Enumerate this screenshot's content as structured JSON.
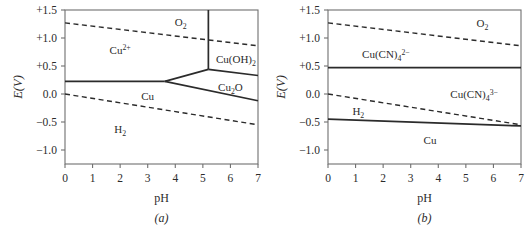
{
  "figure": {
    "panels": [
      {
        "id": "a",
        "caption": "(a)",
        "axes": {
          "xlabel": "pH",
          "ylabel": "E (V)",
          "ylabel_italic": "E",
          "ylabel_paren": "(V)",
          "xlim": [
            0,
            7
          ],
          "ylim": [
            -1.25,
            1.5
          ],
          "xticks": [
            "0",
            "1",
            "2",
            "3",
            "4",
            "5",
            "6",
            "7"
          ],
          "xtick_values": [
            0,
            1,
            2,
            3,
            4,
            5,
            6,
            7
          ],
          "yticks": [
            "+1.5",
            "+1.0",
            "+0.5",
            "0.0",
            "−0.5",
            "−1.0"
          ],
          "ytick_values": [
            1.5,
            1.0,
            0.5,
            0.0,
            -0.5,
            -1.0
          ],
          "grid": false
        },
        "regions": [
          {
            "name": "cu2plus",
            "text": "Cu",
            "sup": "2+",
            "sub": "",
            "x": 2.0,
            "y": 0.78
          },
          {
            "name": "o2",
            "text": "O",
            "sup": "",
            "sub": "2",
            "x": 4.2,
            "y": 1.28
          },
          {
            "name": "cu-oh-2",
            "text": "Cu(OH)",
            "sup": "",
            "sub": "2",
            "x": 6.2,
            "y": 0.62
          },
          {
            "name": "cu2o",
            "text": "Cu",
            "sup": "",
            "sub": "2",
            "text2": "O",
            "x": 6.0,
            "y": 0.12
          },
          {
            "name": "cu-metal",
            "text": "Cu",
            "sup": "",
            "sub": "",
            "x": 3.0,
            "y": -0.03
          },
          {
            "name": "h2",
            "text": "H",
            "sup": "",
            "sub": "2",
            "x": 2.0,
            "y": -0.62
          }
        ],
        "lines": [
          {
            "name": "o2-water-stability-upper",
            "style": "dashed",
            "points": [
              [
                0,
                1.27
              ],
              [
                7,
                0.86
              ]
            ]
          },
          {
            "name": "h2-water-stability-lower",
            "style": "dashed",
            "points": [
              [
                0,
                0.0
              ],
              [
                7,
                -0.55
              ]
            ]
          },
          {
            "name": "cu2plus-cu-boundary",
            "style": "solid",
            "points": [
              [
                0,
                0.225
              ],
              [
                3.62,
                0.225
              ]
            ]
          },
          {
            "name": "cu2plus-cu2o-boundary",
            "style": "solid",
            "points": [
              [
                3.62,
                0.225
              ],
              [
                5.2,
                0.44
              ]
            ]
          },
          {
            "name": "cu-cu2o-boundary",
            "style": "solid",
            "points": [
              [
                3.62,
                0.225
              ],
              [
                7,
                -0.12
              ]
            ]
          },
          {
            "name": "cu2plus-cu-oh-2-vertical",
            "style": "solid",
            "points": [
              [
                5.2,
                1.5
              ],
              [
                5.2,
                0.44
              ]
            ]
          },
          {
            "name": "cu2o-cu-oh-2-boundary",
            "style": "solid",
            "points": [
              [
                5.2,
                0.44
              ],
              [
                7,
                0.33
              ]
            ]
          }
        ]
      },
      {
        "id": "b",
        "caption": "(b)",
        "axes": {
          "xlabel": "pH",
          "ylabel": "E (V)",
          "ylabel_italic": "E",
          "ylabel_paren": "(V)",
          "xlim": [
            0,
            7
          ],
          "ylim": [
            -1.25,
            1.5
          ],
          "xticks": [
            "0",
            "1",
            "2",
            "3",
            "4",
            "5",
            "6",
            "7"
          ],
          "xtick_values": [
            0,
            1,
            2,
            3,
            4,
            5,
            6,
            7
          ],
          "yticks": [
            "+1.5",
            "+1.0",
            "+0.5",
            "0.0",
            "−0.5",
            "−1.0"
          ],
          "ytick_values": [
            1.5,
            1.0,
            0.5,
            0.0,
            -0.5,
            -1.0
          ],
          "grid": false
        },
        "regions": [
          {
            "name": "o2",
            "text": "O",
            "sup": "",
            "sub": "2",
            "x": 5.6,
            "y": 1.27
          },
          {
            "name": "cu-cn-4-2minus",
            "text": "Cu(CN)",
            "sub": "4",
            "sup": "2−",
            "x": 2.1,
            "y": 0.72
          },
          {
            "name": "cu-cn-4-3minus",
            "text": "Cu(CN)",
            "sub": "4",
            "sup": "3−",
            "x": 5.3,
            "y": 0.0
          },
          {
            "name": "h2",
            "text": "H",
            "sup": "",
            "sub": "2",
            "x": 1.1,
            "y": -0.3
          },
          {
            "name": "cu-metal",
            "text": "Cu",
            "sup": "",
            "sub": "",
            "x": 3.7,
            "y": -0.82
          }
        ],
        "lines": [
          {
            "name": "o2-water-stability-upper",
            "style": "dashed",
            "points": [
              [
                0,
                1.27
              ],
              [
                7,
                0.86
              ]
            ]
          },
          {
            "name": "h2-water-stability-lower",
            "style": "dashed",
            "points": [
              [
                0,
                0.0
              ],
              [
                7,
                -0.55
              ]
            ]
          },
          {
            "name": "cu-cn-4-2minus-to-3minus-boundary",
            "style": "solid",
            "points": [
              [
                0,
                0.47
              ],
              [
                7,
                0.47
              ]
            ]
          },
          {
            "name": "cu-cn-4-3minus-cu-boundary",
            "style": "solid",
            "points": [
              [
                0,
                -0.45
              ],
              [
                7,
                -0.57
              ]
            ]
          }
        ]
      }
    ],
    "colors": {
      "line": "#2b2b2b",
      "frame": "#6f6f6f",
      "text": "#2b2b2b",
      "background": "#ffffff"
    }
  }
}
